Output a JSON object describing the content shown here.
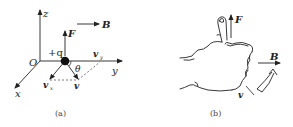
{
  "panel_a": {
    "caption": "(a)",
    "axes": {
      "z": "z",
      "y": "y",
      "x": "x",
      "origin": "O"
    },
    "charge": "+q",
    "force": "F",
    "field": "B",
    "velocity": "v",
    "velocity_x": "v",
    "velocity_x_sub": "x",
    "velocity_y": "v",
    "velocity_y_sub": "y",
    "angle": "θ"
  },
  "panel_b": {
    "caption": "(b)",
    "force": "F",
    "field": "B",
    "velocity": "v"
  },
  "colors": {
    "line": "#222222",
    "dashed": "#555555",
    "caption": "#444444"
  }
}
